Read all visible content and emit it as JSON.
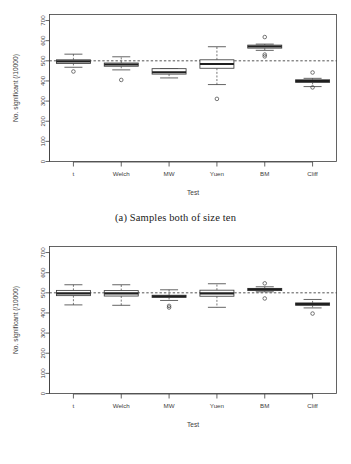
{
  "figure": {
    "panels": [
      {
        "id": "panel-a",
        "caption": "(a) Samples both of size ten",
        "chart_ref": 0
      },
      {
        "id": "panel-b",
        "caption": "(b) Samples both of size thirty",
        "chart_ref": 1
      }
    ]
  },
  "chart_data": [
    {
      "type": "box",
      "title": "",
      "subtitle": "",
      "xlabel": "Test",
      "ylabel": "No. significant (/10000)",
      "categories": [
        "t",
        "Welch",
        "MW",
        "Yuen",
        "BM",
        "Cliff"
      ],
      "ylim": [
        0,
        730
      ],
      "yticks": [
        0,
        100,
        200,
        300,
        400,
        500,
        600,
        700
      ],
      "yticklabels": [
        "0",
        "100",
        "200",
        "300",
        "400",
        "500",
        "600",
        "700"
      ],
      "grid": false,
      "legend": null,
      "reference_line": {
        "y": 500,
        "style": "dashed",
        "label": ""
      },
      "boxes": [
        {
          "category": "t",
          "min": 468,
          "q1": 487,
          "median": 497,
          "q3": 505,
          "max": 533,
          "outliers": [
            447
          ]
        },
        {
          "category": "Welch",
          "min": 455,
          "q1": 473,
          "median": 482,
          "q3": 489,
          "max": 520,
          "outliers": [
            405
          ]
        },
        {
          "category": "MW",
          "min": 415,
          "q1": 434,
          "median": 443,
          "q3": 461,
          "max": 461,
          "outliers": []
        },
        {
          "category": "Yuen",
          "min": 382,
          "q1": 463,
          "median": 484,
          "q3": 505,
          "max": 570,
          "outliers": [
            311
          ]
        },
        {
          "category": "BM",
          "min": 552,
          "q1": 563,
          "median": 571,
          "q3": 578,
          "max": 583,
          "outliers": [
            618,
            531,
            522
          ]
        },
        {
          "category": "Cliff",
          "min": 372,
          "q1": 393,
          "median": 399,
          "q3": 406,
          "max": 413,
          "outliers": [
            442,
            368
          ]
        }
      ]
    },
    {
      "type": "box",
      "title": "",
      "subtitle": "",
      "xlabel": "Test",
      "ylabel": "No. significant (/10000)",
      "categories": [
        "t",
        "Welch",
        "MW",
        "Yuen",
        "BM",
        "Cliff"
      ],
      "ylim": [
        0,
        730
      ],
      "yticks": [
        0,
        100,
        200,
        300,
        400,
        500,
        600,
        700
      ],
      "yticklabels": [
        "0",
        "100",
        "200",
        "300",
        "400",
        "500",
        "600",
        "700"
      ],
      "grid": false,
      "legend": null,
      "reference_line": {
        "y": 500,
        "style": "dashed",
        "label": ""
      },
      "boxes": [
        {
          "category": "t",
          "min": 440,
          "q1": 486,
          "median": 497,
          "q3": 512,
          "max": 540,
          "outliers": []
        },
        {
          "category": "Welch",
          "min": 438,
          "q1": 484,
          "median": 497,
          "q3": 511,
          "max": 540,
          "outliers": []
        },
        {
          "category": "MW",
          "min": 462,
          "q1": 477,
          "median": 483,
          "q3": 488,
          "max": 515,
          "outliers": [
            435,
            427
          ]
        },
        {
          "category": "Yuen",
          "min": 428,
          "q1": 483,
          "median": 497,
          "q3": 513,
          "max": 545,
          "outliers": []
        },
        {
          "category": "BM",
          "min": 505,
          "q1": 511,
          "median": 517,
          "q3": 522,
          "max": 530,
          "outliers": [
            547,
            472
          ]
        },
        {
          "category": "Cliff",
          "min": 425,
          "q1": 438,
          "median": 444,
          "q3": 450,
          "max": 467,
          "outliers": [
            397
          ]
        }
      ]
    }
  ]
}
